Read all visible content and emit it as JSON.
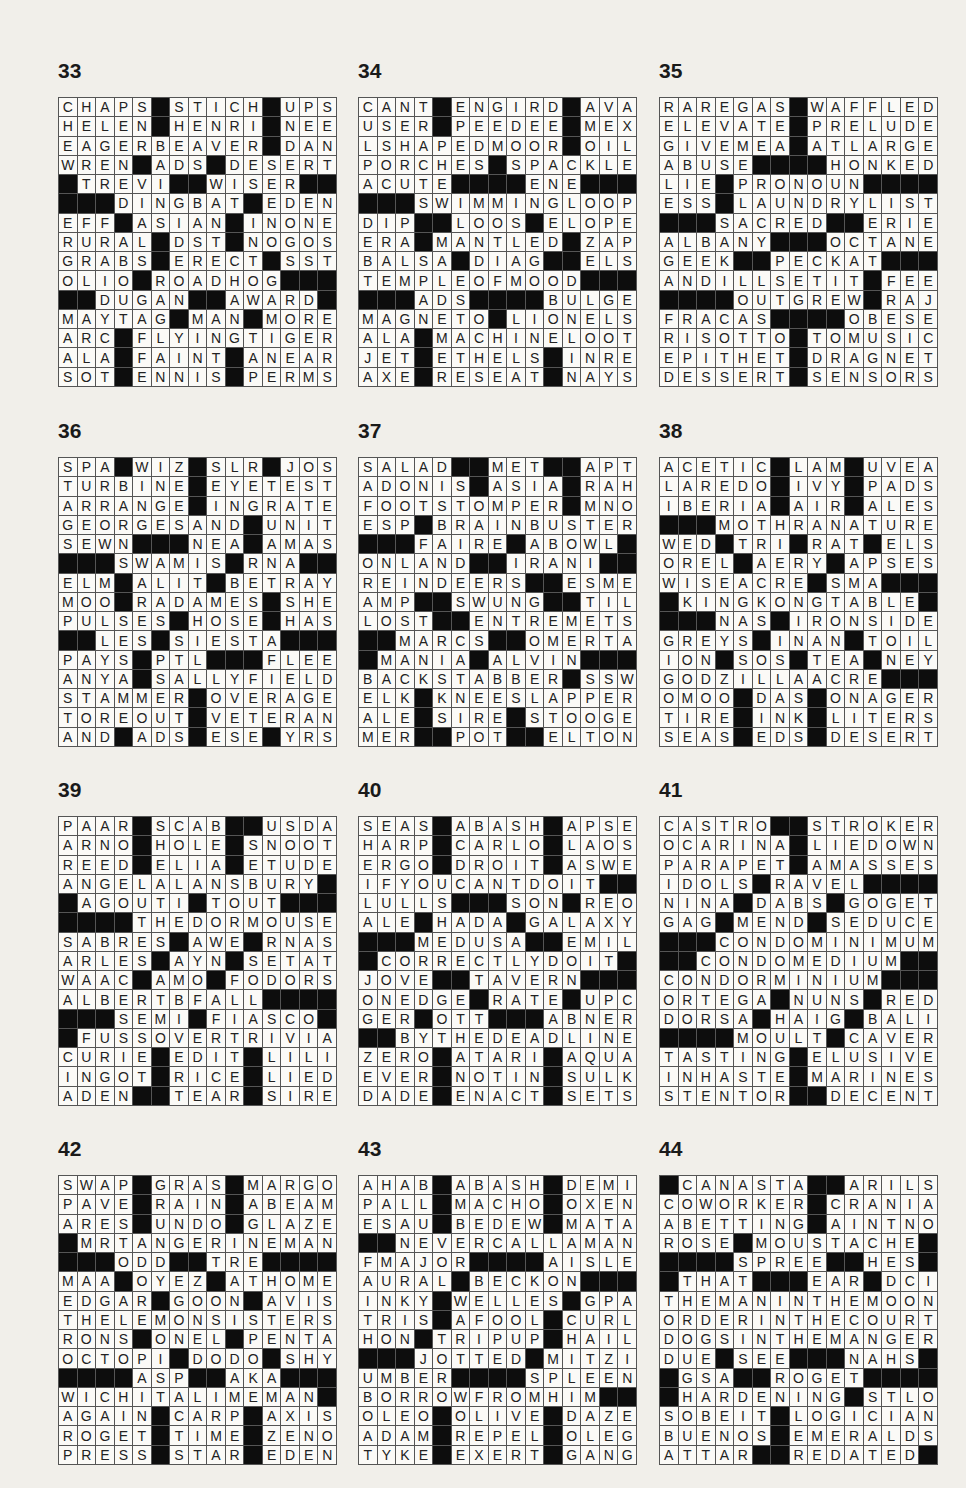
{
  "page": {
    "background": "#f1efea",
    "black_square_color": "#0d0d0d",
    "layout": {
      "columns": 3,
      "rows": 4
    }
  },
  "puzzles": [
    {
      "number": "33",
      "rows": [
        "CHAPS#STICH#UPS",
        "HELEN#HENRI#NEE",
        "EAGERBEAVER#DAN",
        "WREN#ADS#DESERT",
        "#TREVI##WISER##",
        "###DINGBAT#EDEN",
        "EFF#ASIAN#INONE",
        "RURAL#DST#NOGOS",
        "GRABS#ERECT#SST",
        "OLIO#ROADHOG###",
        "##DUGAN##AWARD#",
        "MAYTAG#MAN#MORE",
        "ARC#FLYINGTIGER",
        "ALA#FAINT#ANEAR",
        "SOT#ENNIS#PERMS"
      ]
    },
    {
      "number": "34",
      "rows": [
        "CANT#ENGIRD#AVA",
        "USER#PEEDEE#MEX",
        "LSHAPEDMOOR#OIL",
        "PORCHES#SPACKLE",
        "ACUTE####ENE###",
        "###SWIMMINGLOOP",
        "DIP##LOOS#ELOPE",
        "ERA#MANTLED#ZAP",
        "BALSA#DIAG##ELS",
        "TEMPLEOFMOOD###",
        "###ADS####BULGE",
        "MAGNETO#LIONELS",
        "ALA#MACHINELOOT",
        "JET#ETHELS#INRE",
        "AXE#RESEAT#NAYS"
      ]
    },
    {
      "number": "35",
      "rows": [
        "RAREGAS#WAFFLED",
        "ELEVATE#PRELUDE",
        "GIVEMEA#ATLARGE",
        "ABUSE####HONKED",
        "LIE#PRONOUN####",
        "ESS#LAUNDRYLIST",
        "###SACRED##ERIE",
        "ALBANY###OCTANE",
        "GEEK##PECKAT###",
        "ANDILLSETIT#FEE",
        "####OUTGREW#RAJ",
        "FRACAS####OBESE",
        "RISOTTO#TOMUSIC",
        "EPITHET#DRAGNET",
        "DESSERT#SENSORS"
      ]
    },
    {
      "number": "36",
      "rows": [
        "SPA#WIZ#SLR#JOS",
        "TURBINE#EYETEST",
        "ARRANGE#INGRATE",
        "GEORGESAND#UNIT",
        "SEWN###NEA#AMAS",
        "###SWAMIS#RNA##",
        "ELM#ALIT#BETRAY",
        "MOO#RADAMES#SHE",
        "PULSES#HOSE#HAS",
        "##LES#SIESTA###",
        "PAYS#PTL###FLEE",
        "ANYA#SALLYFIELD",
        "STAMMER#OVERAGE",
        "TOREOUT#VETERAN",
        "AND#ADS#ESE#YRS"
      ]
    },
    {
      "number": "37",
      "rows": [
        "SALAD##MET##APT",
        "ADONIS#ASIA#RAH",
        "FOOTSTOMPER#MNO",
        "ESP#BRAINBUSTER",
        "###FAIRE#ABOWL#",
        "ONLAND##IRANI##",
        "REINDEERS##ESME",
        "AMP##SWUNG##TIL",
        "LOST##ENTREMETS",
        "##MARCS##OMERTA",
        "#MANIA#ALVIN###",
        "BACKSTABBER#SSW",
        "ELK#KNEESLAPPER",
        "ALE#SIRE#STOOGE",
        "MER##POT##ELTON"
      ]
    },
    {
      "number": "38",
      "rows": [
        "ACETIC#LAM#UVEA",
        "LAREDO#IVY#PADS",
        "IBERIA#AIR#ALES",
        "###MOTHRANATURE",
        "WED#TRI#RAT#ELS",
        "OREL#AERY#APSES",
        "WISEACRE#SMA###",
        "#KINGKONGTABLE#",
        "###NAS#IRONSIDE",
        "GREYS#INAN#TOIL",
        "ION#SOS#TEA#NEY",
        "GODZILLAACRE###",
        "OMOO#DAS#ONAGER",
        "TIRE#INK#LITERS",
        "SEAS#EDS#DESERT"
      ]
    },
    {
      "number": "39",
      "rows": [
        "PAAR#SCAB##USDA",
        "ARNO#HOLE#SNOOT",
        "REED#ELIA#ETUDE",
        "ANGELALANSBURY#",
        "#AGOUTI#TOUT###",
        "####THEDORMOUSE",
        "SABRES#AWE#RNAS",
        "ARLES#AYN#SETAT",
        "WAAC#AMO#FODORS",
        "ALBERTBFALL####",
        "###SEMI#FIASCO#",
        "#FUSSOVERTRIVIA",
        "CURIE#EDIT#LILI",
        "INGOT#RICE#LIED",
        "ADEN##TEAR#SIRE"
      ]
    },
    {
      "number": "40",
      "rows": [
        "SEAS#ABASH#APSE",
        "HARP#CARLO#LAOS",
        "ERGO#DROIT#ASWE",
        "IFYOUCANTDOIT##",
        "LULLS###SON#REO",
        "ALE#HADA#GALAXY",
        "###MEDUSA##EMIL",
        "#CORRECTLYDOIT#",
        "JOVE##TAVERN###",
        "ONEDGE#RATE#UPC",
        "GER#OTT###ABNER",
        "##BYTHEDEADLINE",
        "ZERO#ATARI#AQUA",
        "EVER#NOTIN#SULK",
        "DADE#ENACT#SETS"
      ]
    },
    {
      "number": "41",
      "rows": [
        "CASTRO##STROKER",
        "OCARINA#LIEDOWN",
        "PARAPET#AMASSES",
        "IDOLS#RAVEL####",
        "NINA#DABS#GOGET",
        "GAG#MEND#SEDUCE",
        "###CONDOMINIMUM",
        "##CONDOMEDIUM##",
        "CONDORMINIUM###",
        "ORTEGA#NUNS#RED",
        "DORSA#HAIG#BALI",
        "####MOULT#CAVER",
        "TASTING#ELUSIVE",
        "INHASTE#MARINES",
        "STENTOR##DECENT"
      ]
    },
    {
      "number": "42",
      "rows": [
        "SWAP#GRAS#MARGO",
        "PAVE#RAIN#ABEAM",
        "ARES#UNDO#GLAZE",
        "#MRTANGERINEMAN",
        "###ODD##TRE####",
        "MAA#OYEZ#ATHOME",
        "EDGAR#GOON#AVIS",
        "THELEMONSISTERS",
        "RONS#ONEL#PENTA",
        "OCTOPI#DODO#SHY",
        "####ASP##AKA###",
        "WICHITALIMEMAN#",
        "AGAIN#CARP#AXIS",
        "ROGET#TIME#ZENO",
        "PRESS#STAR#EDEN"
      ]
    },
    {
      "number": "43",
      "rows": [
        "AHAB#ABASH#DEMI",
        "PALL#MACHO#OXEN",
        "ESAU#BEDEW#MATA",
        "##NEVERCALLAMAN",
        "FMAJOR####AISLE",
        "AURAL#BECKON###",
        "INKY#WELLES#GPA",
        "TRIS#AFOOL#CURL",
        "HON#TRIPUP#HAIL",
        "###JOTTED#MITZI",
        "UMBER####SPLEEN",
        "BORROWFROMHIM##",
        "OLEO#OLIVE#DAZE",
        "ADAM#REPEL#OLEG",
        "TYKE#EXERT#GANG"
      ]
    },
    {
      "number": "44",
      "rows": [
        "#CANASTA##ARILS",
        "COWORKER#CRANIA",
        "ABETTING#AINTNO",
        "ROSE#MOUSTACHE#",
        "####SPREE##HES#",
        "#THAT###EAR#DCI",
        "THEMANINTHEMOON",
        "ORDERINTHECOURT",
        "DOGSINTHEMANGER",
        "DUE#SEE###NAHS#",
        "#GSA##ROGET####",
        "#HARDENING#STLO",
        "SOBEIT#LOGICIAN",
        "BUENOS#EMERALDS",
        "ATTAR##REDATED#"
      ]
    }
  ]
}
